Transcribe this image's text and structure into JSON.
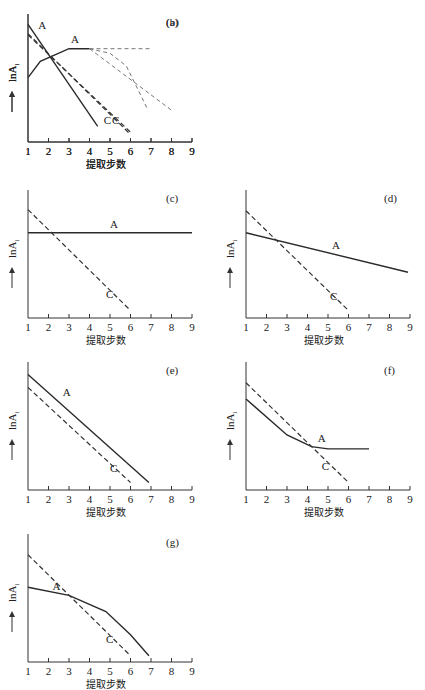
{
  "figure": {
    "xlabel": "提取步数",
    "ylabel": "lnA",
    "ylabel_sub": "i",
    "x_ticks": [
      "1",
      "2",
      "3",
      "4",
      "5",
      "6",
      "7",
      "8",
      "9"
    ]
  },
  "chart_data": [
    {
      "panel": "(a)",
      "type": "line",
      "xlabel": "提取步数",
      "ylabel": "lnA_i",
      "xlim": [
        1,
        9
      ],
      "ylim": [
        0,
        10
      ],
      "series": [
        {
          "name": "A",
          "style": "solid",
          "points": [
            [
              1,
              5.2
            ],
            [
              1.6,
              6.6
            ],
            [
              3,
              7.7
            ],
            [
              4,
              7.7
            ]
          ]
        },
        {
          "name": "A-branch-flat",
          "style": "dashed-light",
          "points": [
            [
              4,
              7.7
            ],
            [
              7,
              7.7
            ]
          ]
        },
        {
          "name": "A-branch-bend",
          "style": "dashed-light",
          "points": [
            [
              4,
              7.7
            ],
            [
              5,
              7.3
            ],
            [
              5.8,
              6.2
            ],
            [
              6.8,
              2.6
            ]
          ]
        },
        {
          "name": "A-branch-straight",
          "style": "dashed-light",
          "points": [
            [
              4,
              7.7
            ],
            [
              8,
              2.4
            ]
          ]
        },
        {
          "name": "C",
          "style": "dashed",
          "points": [
            [
              1,
              9.0
            ],
            [
              6,
              0.3
            ]
          ]
        }
      ],
      "labels": [
        {
          "text": "A",
          "x": 3.1,
          "y": 8.2
        },
        {
          "text": "C",
          "x": 4.7,
          "y": 1.2
        }
      ]
    },
    {
      "panel": "(b)",
      "type": "line",
      "xlabel": "提取步数",
      "ylabel": "lnA_i",
      "xlim": [
        1,
        9
      ],
      "ylim": [
        0,
        10
      ],
      "series": [
        {
          "name": "A",
          "style": "solid",
          "points": [
            [
              1,
              9.8
            ],
            [
              4.4,
              1.0
            ]
          ]
        },
        {
          "name": "C",
          "style": "dashed",
          "points": [
            [
              1,
              8.9
            ],
            [
              6,
              0.5
            ]
          ]
        }
      ],
      "labels": [
        {
          "text": "A",
          "x": 1.5,
          "y": 9.4
        },
        {
          "text": "C",
          "x": 5.1,
          "y": 1.2
        }
      ]
    },
    {
      "panel": "(c)",
      "type": "line",
      "xlabel": "提取步数",
      "ylabel": "lnA_i",
      "xlim": [
        1,
        9
      ],
      "ylim": [
        0,
        10
      ],
      "series": [
        {
          "name": "A",
          "style": "solid",
          "points": [
            [
              1,
              7.0
            ],
            [
              9,
              7.0
            ]
          ]
        },
        {
          "name": "C",
          "style": "dashed",
          "points": [
            [
              1,
              9.0
            ],
            [
              6,
              0.3
            ]
          ]
        }
      ],
      "labels": [
        {
          "text": "A",
          "x": 5.0,
          "y": 7.4
        },
        {
          "text": "C",
          "x": 4.8,
          "y": 1.4
        }
      ]
    },
    {
      "panel": "(d)",
      "type": "line",
      "xlabel": "提取步数",
      "ylabel": "lnA_i",
      "xlim": [
        1,
        9
      ],
      "ylim": [
        0,
        10
      ],
      "series": [
        {
          "name": "A",
          "style": "solid",
          "points": [
            [
              1,
              7.0
            ],
            [
              8.9,
              3.6
            ]
          ]
        },
        {
          "name": "C",
          "style": "dashed",
          "points": [
            [
              1,
              8.9
            ],
            [
              6,
              0.3
            ]
          ]
        }
      ],
      "labels": [
        {
          "text": "A",
          "x": 5.2,
          "y": 5.6
        },
        {
          "text": "C",
          "x": 5.1,
          "y": 1.2
        }
      ]
    },
    {
      "panel": "(e)",
      "type": "line",
      "xlabel": "提取步数",
      "ylabel": "lnA_i",
      "xlim": [
        1,
        9
      ],
      "ylim": [
        0,
        10
      ],
      "series": [
        {
          "name": "A",
          "style": "solid",
          "points": [
            [
              1,
              9.6
            ],
            [
              6.9,
              0.3
            ]
          ]
        },
        {
          "name": "C",
          "style": "dashed",
          "points": [
            [
              1,
              8.5
            ],
            [
              6,
              0.3
            ]
          ]
        }
      ],
      "labels": [
        {
          "text": "A",
          "x": 2.7,
          "y": 7.8
        },
        {
          "text": "C",
          "x": 5.0,
          "y": 1.2
        }
      ]
    },
    {
      "panel": "(f)",
      "type": "line",
      "xlabel": "提取步数",
      "ylabel": "lnA_i",
      "xlim": [
        1,
        9
      ],
      "ylim": [
        0,
        10
      ],
      "series": [
        {
          "name": "A",
          "style": "solid",
          "points": [
            [
              1,
              7.5
            ],
            [
              3,
              4.4
            ],
            [
              4.2,
              3.4
            ],
            [
              5,
              3.2
            ],
            [
              7,
              3.2
            ]
          ]
        },
        {
          "name": "C",
          "style": "dashed",
          "points": [
            [
              1,
              8.9
            ],
            [
              6,
              0.3
            ]
          ]
        }
      ],
      "labels": [
        {
          "text": "A",
          "x": 4.5,
          "y": 3.8
        },
        {
          "text": "C",
          "x": 4.7,
          "y": 1.4
        }
      ]
    },
    {
      "panel": "(g)",
      "type": "line",
      "xlabel": "提取步数",
      "ylabel": "lnA_i",
      "xlim": [
        1,
        9
      ],
      "ylim": [
        0,
        10
      ],
      "series": [
        {
          "name": "A",
          "style": "solid",
          "points": [
            [
              1,
              6.1
            ],
            [
              3,
              5.4
            ],
            [
              4.8,
              4.0
            ],
            [
              6,
              2.0
            ],
            [
              6.9,
              0.2
            ]
          ]
        },
        {
          "name": "C",
          "style": "dashed",
          "points": [
            [
              1,
              8.9
            ],
            [
              6,
              0.2
            ]
          ]
        }
      ],
      "labels": [
        {
          "text": "A",
          "x": 2.2,
          "y": 5.9
        },
        {
          "text": "C",
          "x": 4.8,
          "y": 1.3
        }
      ]
    }
  ]
}
